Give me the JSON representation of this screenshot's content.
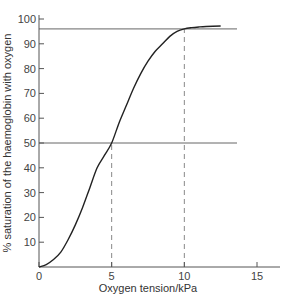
{
  "chart_data": {
    "type": "line",
    "title": "",
    "xlabel": "Oxygen tension/kPa",
    "ylabel": "% saturation of the haemoglobin with oxygen",
    "xlim": [
      0,
      16.5
    ],
    "ylim": [
      0,
      100
    ],
    "x_ticks": [
      0,
      5,
      10,
      15
    ],
    "y_ticks": [
      10,
      20,
      30,
      40,
      50,
      60,
      70,
      80,
      90,
      100
    ],
    "grid": false,
    "legend": null,
    "series": [
      {
        "name": "Oxyhaemoglobin dissociation curve",
        "x": [
          0,
          0.5,
          1,
          1.5,
          2,
          2.5,
          3,
          3.5,
          4,
          4.5,
          5,
          5.5,
          6,
          6.5,
          7,
          7.5,
          8,
          8.5,
          9,
          9.5,
          10,
          10.5,
          11,
          11.5,
          12.5
        ],
        "y": [
          0,
          1,
          3,
          6,
          11,
          17,
          24,
          32,
          40,
          45,
          50,
          58,
          65,
          72,
          78,
          83,
          87,
          90,
          93,
          95,
          96,
          96.5,
          96.8,
          97,
          97.2
        ]
      }
    ],
    "reference_lines": [
      {
        "type": "horizontal",
        "y": 96,
        "style": "solid"
      },
      {
        "type": "horizontal",
        "y": 50,
        "style": "solid"
      },
      {
        "type": "vertical",
        "x": 5,
        "style": "dashed",
        "from_y": 0,
        "to_y": 50
      },
      {
        "type": "vertical",
        "x": 10,
        "style": "dashed",
        "from_y": 0,
        "to_y": 96
      }
    ],
    "colors": {
      "curve": "#222222",
      "axes": "#555555",
      "reference": "#666666",
      "dashed": "#888888"
    }
  }
}
